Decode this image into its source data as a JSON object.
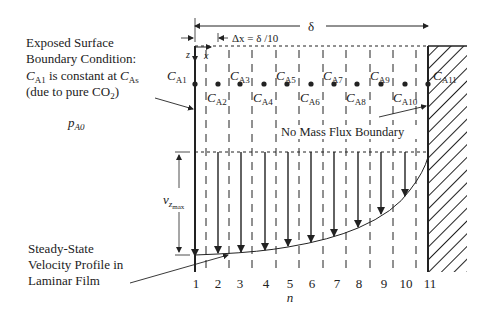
{
  "labels": {
    "boundary_line1": "Exposed Surface",
    "boundary_line2": "Boundary Condition:",
    "boundary_line3_c": "C",
    "boundary_line3_sub": "A1",
    "boundary_line3_mid": " is constant at ",
    "boundary_line3_c2": "C",
    "boundary_line3_sub2": "As",
    "boundary_line4_pre": "(due to pure CO",
    "boundary_line4_sub": "2",
    "boundary_line4_post": ")",
    "pressure_p": "p",
    "pressure_sub": "A0",
    "delta": "δ",
    "dx_label": "Δx = δ /10",
    "axis_z": "z",
    "axis_x": "x",
    "vz_v": "v",
    "vz_z": "z",
    "vz_max": "max",
    "no_flux": "No Mass Flux Boundary",
    "velocity_line1": "Steady-State",
    "velocity_line2": "Velocity Profile in",
    "velocity_line3": "Laminar Film",
    "n_axis": "n"
  },
  "nodes": [
    {
      "n": "1",
      "label_c": "C",
      "label_sub": "A1"
    },
    {
      "n": "2",
      "label_c": "C",
      "label_sub": "A2"
    },
    {
      "n": "3",
      "label_c": "C",
      "label_sub": "A3"
    },
    {
      "n": "4",
      "label_c": "C",
      "label_sub": "A4"
    },
    {
      "n": "5",
      "label_c": "C",
      "label_sub": "A5"
    },
    {
      "n": "6",
      "label_c": "C",
      "label_sub": "A6"
    },
    {
      "n": "7",
      "label_c": "C",
      "label_sub": "A7"
    },
    {
      "n": "8",
      "label_c": "C",
      "label_sub": "A8"
    },
    {
      "n": "9",
      "label_c": "C",
      "label_sub": "A9"
    },
    {
      "n": "10",
      "label_c": "C",
      "label_sub": "A10"
    },
    {
      "n": "11",
      "label_c": "C",
      "label_sub": "A11"
    }
  ],
  "colors": {
    "ink": "#222222",
    "background": "#ffffff"
  }
}
